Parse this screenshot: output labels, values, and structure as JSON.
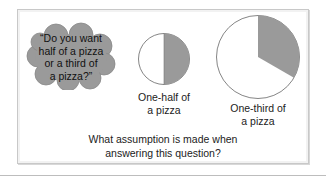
{
  "speech_bubble": {
    "lines": [
      "“Do you want",
      "half of a pizza",
      "or a third of",
      "a pizza?”"
    ]
  },
  "pizzas": [
    {
      "label_lines": [
        "One-half of",
        "a pizza"
      ],
      "fraction": 0.5,
      "fill_color": "#9a9a9a"
    },
    {
      "label_lines": [
        "One-third of",
        "a pizza"
      ],
      "fraction": 0.3333,
      "fill_color": "#9a9a9a"
    }
  ],
  "question": {
    "lines": [
      "What assumption is made when",
      "answering this question?"
    ]
  },
  "colors": {
    "cloud": "#9a9a9a",
    "frame_border": "#c8c8c8",
    "circle_outline": "#777777"
  }
}
